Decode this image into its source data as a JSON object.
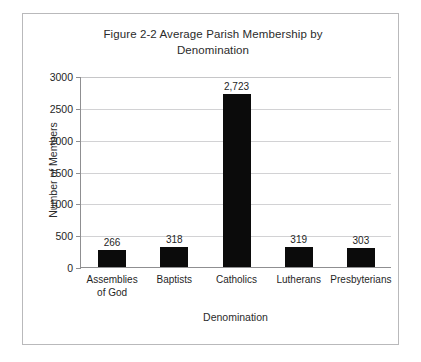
{
  "figure": {
    "title_line_1": "Figure 2-2 Average Parish Membership by",
    "title_line_2": "Denomination",
    "border_color": "#b9b9bb",
    "background_color": "#ffffff"
  },
  "chart_data": {
    "type": "bar",
    "title": "Figure 2-2 Average Parish Membership by Denomination",
    "xlabel": "Denomination",
    "ylabel": "Number of Members",
    "categories": [
      "Assemblies of God",
      "Baptists",
      "Catholics",
      "Lutherans",
      "Presbyterians"
    ],
    "category_lines": [
      [
        "Assemblies",
        "of God"
      ],
      [
        "Baptists"
      ],
      [
        "Catholics"
      ],
      [
        "Lutherans"
      ],
      [
        "Presbyterians"
      ]
    ],
    "values": [
      266,
      318,
      2723,
      319,
      303
    ],
    "value_labels": [
      "266",
      "318",
      "2,723",
      "319",
      "303"
    ],
    "ylim": [
      0,
      3000
    ],
    "yticks": [
      0,
      500,
      1000,
      1500,
      2000,
      2500,
      3000
    ],
    "ytick_labels": [
      "0",
      "500",
      "1000",
      "1500",
      "2000",
      "2500",
      "3000"
    ],
    "grid": "horizontal",
    "legend": "none",
    "bar_color": "#0b0b0b",
    "gridline_color": "#d2d2d4",
    "axis_color": "#8f8f91"
  }
}
